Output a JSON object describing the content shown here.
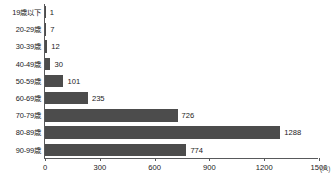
{
  "chart_data": {
    "type": "bar",
    "orientation": "horizontal",
    "title": "",
    "xlabel": "(人)",
    "ylabel": "",
    "xlim": [
      0,
      1500
    ],
    "xticks": [
      0,
      300,
      600,
      900,
      1200,
      1500
    ],
    "xtick_labels": [
      "0",
      "300",
      "600",
      "900",
      "1200",
      "1500"
    ],
    "grid": false,
    "legend": null,
    "bar_color": "#4c4c4c",
    "axis_color": "#58595b",
    "categories": [
      "19歳以下",
      "20-29歳",
      "30-39歳",
      "40-49歳",
      "50-59歳",
      "60-69歳",
      "70-79歳",
      "80-89歳",
      "90-99歳"
    ],
    "values": [
      1,
      7,
      12,
      30,
      101,
      235,
      726,
      1288,
      774
    ],
    "value_labels": [
      "1",
      "7",
      "12",
      "30",
      "101",
      "235",
      "726",
      "1288",
      "774"
    ]
  }
}
